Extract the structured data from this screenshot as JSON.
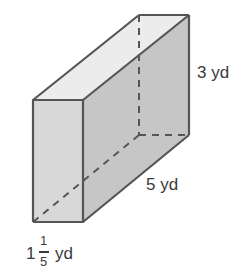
{
  "diagram": {
    "shape": "rectangular prism",
    "labels": {
      "height": "3 yd",
      "length": "5 yd",
      "width_whole": "1",
      "width_num": "1",
      "width_den": "5",
      "width_unit": "yd"
    },
    "colors": {
      "front_face": "#d6d6d6",
      "side_face": "#c4c4c4",
      "top_face": "#ececec",
      "edge": "#555555"
    }
  }
}
